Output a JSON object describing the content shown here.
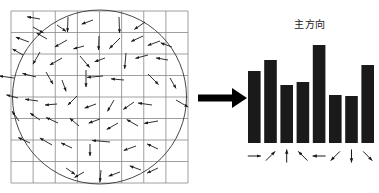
{
  "figure": {
    "name": "sift-descriptor-orientation-histogram",
    "background": "#ffffff",
    "width": 379,
    "height": 193
  },
  "patch": {
    "name": "gradient-orientation-patch",
    "grid_columns": 8,
    "grid_rows": 8,
    "grid_color": "#888888",
    "circle_color": "#333333",
    "arrow_color": "#1a1a1a",
    "description": "8 by 8 sampled image patch with a circular Gaussian weighting window and per-pixel gradient orientation arrows",
    "arrows": [
      {
        "x": 40,
        "y": 19,
        "angle": 170,
        "len": 13
      },
      {
        "x": 68,
        "y": 17,
        "angle": 268,
        "len": 15
      },
      {
        "x": 93,
        "y": 20,
        "angle": 200,
        "len": 12
      },
      {
        "x": 119,
        "y": 17,
        "angle": 272,
        "len": 16
      },
      {
        "x": 145,
        "y": 22,
        "angle": 215,
        "len": 13
      },
      {
        "x": 33,
        "y": 27,
        "angle": 330,
        "len": 12
      },
      {
        "x": 57,
        "y": 25,
        "angle": 325,
        "len": 11
      },
      {
        "x": 29,
        "y": 42,
        "angle": 160,
        "len": 14
      },
      {
        "x": 47,
        "y": 39,
        "angle": 150,
        "len": 12
      },
      {
        "x": 67,
        "y": 40,
        "angle": 210,
        "len": 14
      },
      {
        "x": 84,
        "y": 46,
        "angle": 195,
        "len": 11
      },
      {
        "x": 99,
        "y": 36,
        "angle": 268,
        "len": 14
      },
      {
        "x": 120,
        "y": 38,
        "angle": 225,
        "len": 15
      },
      {
        "x": 143,
        "y": 36,
        "angle": 205,
        "len": 13
      },
      {
        "x": 160,
        "y": 41,
        "angle": 200,
        "len": 13
      },
      {
        "x": 172,
        "y": 47,
        "angle": 160,
        "len": 12
      },
      {
        "x": 23,
        "y": 55,
        "angle": 150,
        "len": 12
      },
      {
        "x": 40,
        "y": 52,
        "angle": 240,
        "len": 14
      },
      {
        "x": 62,
        "y": 58,
        "angle": 210,
        "len": 14
      },
      {
        "x": 80,
        "y": 56,
        "angle": 310,
        "len": 15
      },
      {
        "x": 105,
        "y": 58,
        "angle": 200,
        "len": 11
      },
      {
        "x": 126,
        "y": 53,
        "angle": 265,
        "len": 16
      },
      {
        "x": 148,
        "y": 55,
        "angle": 195,
        "len": 13
      },
      {
        "x": 168,
        "y": 60,
        "angle": 170,
        "len": 12
      },
      {
        "x": 14,
        "y": 78,
        "angle": 172,
        "len": 15
      },
      {
        "x": 36,
        "y": 77,
        "angle": 165,
        "len": 14
      },
      {
        "x": 46,
        "y": 72,
        "angle": 300,
        "len": 14
      },
      {
        "x": 62,
        "y": 80,
        "angle": 290,
        "len": 12
      },
      {
        "x": 86,
        "y": 70,
        "angle": 270,
        "len": 17
      },
      {
        "x": 103,
        "y": 76,
        "angle": 185,
        "len": 16
      },
      {
        "x": 124,
        "y": 80,
        "angle": 175,
        "len": 13
      },
      {
        "x": 148,
        "y": 74,
        "angle": 315,
        "len": 15
      },
      {
        "x": 170,
        "y": 78,
        "angle": 300,
        "len": 12
      },
      {
        "x": 18,
        "y": 98,
        "angle": 165,
        "len": 12
      },
      {
        "x": 38,
        "y": 101,
        "angle": 172,
        "len": 13
      },
      {
        "x": 57,
        "y": 104,
        "angle": 185,
        "len": 12
      },
      {
        "x": 77,
        "y": 96,
        "angle": 225,
        "len": 13
      },
      {
        "x": 96,
        "y": 104,
        "angle": 200,
        "len": 12
      },
      {
        "x": 114,
        "y": 100,
        "angle": 240,
        "len": 13
      },
      {
        "x": 134,
        "y": 102,
        "angle": 215,
        "len": 13
      },
      {
        "x": 152,
        "y": 105,
        "angle": 172,
        "len": 14
      },
      {
        "x": 176,
        "y": 100,
        "angle": 330,
        "len": 14
      },
      {
        "x": 19,
        "y": 121,
        "angle": 125,
        "len": 12
      },
      {
        "x": 40,
        "y": 120,
        "angle": 145,
        "len": 12
      },
      {
        "x": 58,
        "y": 123,
        "angle": 155,
        "len": 13
      },
      {
        "x": 79,
        "y": 126,
        "angle": 140,
        "len": 12
      },
      {
        "x": 100,
        "y": 119,
        "angle": 200,
        "len": 12
      },
      {
        "x": 118,
        "y": 123,
        "angle": 210,
        "len": 13
      },
      {
        "x": 138,
        "y": 126,
        "angle": 150,
        "len": 13
      },
      {
        "x": 158,
        "y": 121,
        "angle": 190,
        "len": 14
      },
      {
        "x": 30,
        "y": 143,
        "angle": 155,
        "len": 13
      },
      {
        "x": 52,
        "y": 145,
        "angle": 150,
        "len": 14
      },
      {
        "x": 72,
        "y": 148,
        "angle": 155,
        "len": 12
      },
      {
        "x": 90,
        "y": 144,
        "angle": 270,
        "len": 12
      },
      {
        "x": 110,
        "y": 142,
        "angle": 175,
        "len": 18
      },
      {
        "x": 136,
        "y": 146,
        "angle": 200,
        "len": 13
      },
      {
        "x": 158,
        "y": 149,
        "angle": 155,
        "len": 12
      },
      {
        "x": 66,
        "y": 168,
        "angle": 325,
        "len": 11
      },
      {
        "x": 84,
        "y": 172,
        "angle": 210,
        "len": 11
      },
      {
        "x": 101,
        "y": 170,
        "angle": 265,
        "len": 12
      },
      {
        "x": 120,
        "y": 172,
        "angle": 200,
        "len": 12
      },
      {
        "x": 141,
        "y": 170,
        "angle": 160,
        "len": 12
      },
      {
        "x": 158,
        "y": 168,
        "angle": 205,
        "len": 12
      }
    ]
  },
  "transform_arrow": {
    "name": "transform-arrow",
    "label": "",
    "direction": "right",
    "color": "#000000"
  },
  "chart_data": {
    "type": "bar",
    "title": "主方向",
    "title_note": "dominant direction label above the tallest bin",
    "xlabel": "",
    "ylabel": "",
    "categories": [
      "→",
      "↗",
      "↑",
      "↖",
      "←",
      "↙",
      "↓",
      "↘"
    ],
    "category_names": [
      "east",
      "north-east",
      "north",
      "north-west",
      "west",
      "south-west",
      "south",
      "south-east"
    ],
    "values": [
      72,
      83,
      58,
      61,
      98,
      48,
      47,
      78
    ],
    "ylim": [
      0,
      100
    ],
    "grid": false,
    "legend": null,
    "bar_color": "#1a1a1a",
    "dominant_index": 4
  }
}
